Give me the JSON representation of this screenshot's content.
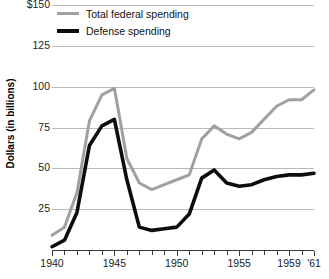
{
  "chart_data": {
    "type": "line",
    "title": "",
    "subtitle": "",
    "xlabel": "",
    "ylabel": "Dollars (in billions)",
    "xlim": [
      1940,
      1961
    ],
    "ylim": [
      0,
      150
    ],
    "grid": true,
    "legend_position": "top-left",
    "y_ticks": [
      "$150",
      "125",
      "100",
      "75",
      "50",
      "25"
    ],
    "y_tick_values": [
      150,
      125,
      100,
      75,
      50,
      25
    ],
    "x_ticks": [
      "1940",
      "1945",
      "1950",
      "1955",
      "1959",
      "'61"
    ],
    "x_tick_values": [
      1940,
      1945,
      1950,
      1955,
      1959,
      1961
    ],
    "x": [
      1940,
      1941,
      1942,
      1943,
      1944,
      1945,
      1946,
      1947,
      1948,
      1949,
      1950,
      1951,
      1952,
      1953,
      1954,
      1955,
      1956,
      1957,
      1958,
      1959,
      1960,
      1961
    ],
    "series": [
      {
        "name": "Total federal spending",
        "color": "#a0a0a0",
        "values": [
          9,
          14,
          35,
          79,
          95,
          99,
          56,
          41,
          37,
          40,
          43,
          46,
          68,
          76,
          71,
          68,
          72,
          80,
          88,
          92,
          92,
          98
        ]
      },
      {
        "name": "Defense spending",
        "color": "#0d0d0d",
        "values": [
          2,
          6,
          23,
          64,
          76,
          80,
          43,
          14,
          12,
          13,
          14,
          22,
          44,
          49,
          41,
          39,
          40,
          43,
          45,
          46,
          46,
          47
        ]
      }
    ]
  },
  "legend": {
    "items": [
      {
        "label": "Total federal spending",
        "style": "total"
      },
      {
        "label": "Defense spending",
        "style": "defense"
      }
    ]
  },
  "axes": {
    "y_title": "Dollars (in billions)"
  },
  "colors": {
    "total_series": "#a0a0a0",
    "defense_series": "#0d0d0d",
    "gridline": "#b9b9b9",
    "axis": "#3a3a3a",
    "background": "#ffffff"
  }
}
